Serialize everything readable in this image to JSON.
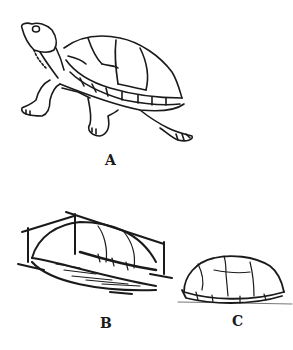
{
  "figure": {
    "panels": [
      {
        "id": "A",
        "label": "A",
        "description": "turtle walking, side view with head raised"
      },
      {
        "id": "B",
        "label": "B",
        "description": "shell in perspective box showing dome and flat plastron"
      },
      {
        "id": "C",
        "label": "C",
        "description": "shell side profile"
      }
    ]
  },
  "colors": {
    "ink": "#1a1a1a",
    "background": "#ffffff"
  }
}
